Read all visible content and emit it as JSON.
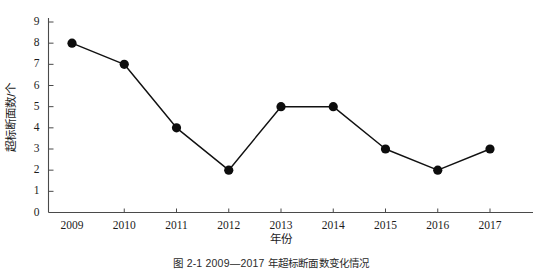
{
  "figure": {
    "caption": "图 2-1  2009—2017 年超标断面数变化情况",
    "background_color": "#ffffff",
    "ink_color": "#111111",
    "axis_color": "#4a4a4a"
  },
  "chart_data": {
    "type": "line",
    "title": "",
    "subtitle": "",
    "xlabel": "年份",
    "ylabel": "超标断面数/个",
    "categories": [
      "2009",
      "2010",
      "2011",
      "2012",
      "2013",
      "2014",
      "2015",
      "2016",
      "2017"
    ],
    "values": [
      8,
      7,
      4,
      2,
      5,
      5,
      3,
      2,
      3
    ],
    "series": [
      {
        "name": "超标断面数",
        "values": [
          8,
          7,
          4,
          2,
          5,
          5,
          3,
          2,
          3
        ]
      }
    ],
    "points": [
      {
        "x": "2009",
        "y": 8
      },
      {
        "x": "2010",
        "y": 7
      },
      {
        "x": "2011",
        "y": 4
      },
      {
        "x": "2012",
        "y": 2
      },
      {
        "x": "2013",
        "y": 5
      },
      {
        "x": "2014",
        "y": 5
      },
      {
        "x": "2015",
        "y": 3
      },
      {
        "x": "2016",
        "y": 2
      },
      {
        "x": "2017",
        "y": 3
      }
    ],
    "ylim": [
      0,
      9
    ],
    "ytick_labels": [
      "0",
      "1",
      "2",
      "3",
      "4",
      "5",
      "6",
      "7",
      "8",
      "9"
    ],
    "ytick_values": [
      0,
      1,
      2,
      3,
      4,
      5,
      6,
      7,
      8,
      9
    ],
    "xtick_labels": [
      "2009",
      "2010",
      "2011",
      "2012",
      "2013",
      "2014",
      "2015",
      "2016",
      "2017"
    ],
    "grid": false,
    "legend": false,
    "legend_position": "none",
    "marker": "filled-circle",
    "line_color": "#111111",
    "marker_color": "#0d0d0d",
    "annotations": []
  }
}
